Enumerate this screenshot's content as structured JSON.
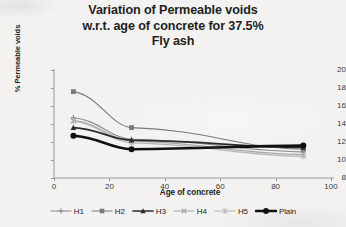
{
  "title_lines": [
    "Variation of Permeable voids",
    "w.r.t. age of concrete for 37.5%",
    "Fly ash"
  ],
  "axes": {
    "x_title": "Age of concrete",
    "y_title": "% Permeable voids",
    "x_ticks": [
      "0",
      "20",
      "40",
      "60",
      "80",
      "100"
    ],
    "y_ticks": [
      "8",
      "10",
      "12",
      "14",
      "16",
      "18",
      "20"
    ]
  },
  "legend": [
    {
      "label": "H1",
      "color": "#8c8c8c",
      "marker": "plus",
      "width": 1.1
    },
    {
      "label": "H2",
      "color": "#7a7a7a",
      "marker": "square",
      "width": 1.1
    },
    {
      "label": "H3",
      "color": "#2b2b2b",
      "marker": "triangle",
      "width": 1.7
    },
    {
      "label": "H4",
      "color": "#a8a8a8",
      "marker": "x",
      "width": 1.1
    },
    {
      "label": "H5",
      "color": "#b4b4b4",
      "marker": "star",
      "width": 1.1
    },
    {
      "label": "Plain",
      "color": "#111111",
      "marker": "circle",
      "width": 2.6
    }
  ],
  "chart_data": {
    "type": "line",
    "title": "Variation of Permeable voids w.r.t. age of concrete for 37.5% Fly ash",
    "xlabel": "Age of concrete",
    "ylabel": "% Permeable voids",
    "xlim": [
      0,
      100
    ],
    "ylim": [
      8,
      20
    ],
    "x": [
      7,
      28,
      90
    ],
    "grid": false,
    "legend_position": "bottom",
    "series": [
      {
        "name": "H1",
        "values": [
          14.7,
          12.3,
          10.9
        ]
      },
      {
        "name": "H2",
        "values": [
          17.6,
          13.6,
          11.2
        ]
      },
      {
        "name": "H3",
        "values": [
          13.6,
          12.2,
          11.4
        ]
      },
      {
        "name": "H4",
        "values": [
          14.4,
          12.1,
          10.6
        ]
      },
      {
        "name": "H5",
        "values": [
          14.3,
          11.9,
          10.4
        ]
      },
      {
        "name": "Plain",
        "values": [
          12.7,
          11.2,
          11.6
        ]
      }
    ]
  }
}
